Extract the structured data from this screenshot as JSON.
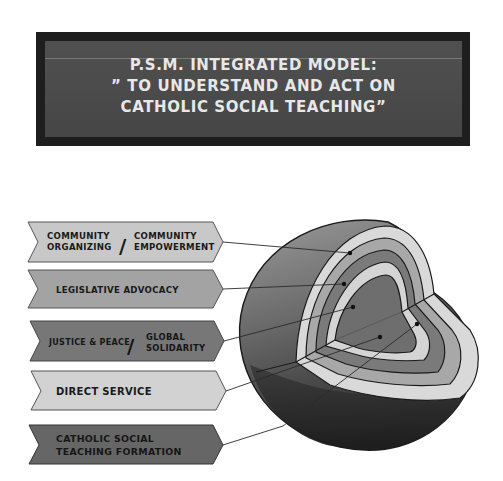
{
  "title": {
    "line1": "P.S.M.  INTEGRATED MODEL:",
    "line2": "” TO UNDERSTAND AND ACT ON",
    "line3": "CATHOLIC  SOCIAL TEACHING”"
  },
  "layers": [
    {
      "id": "community",
      "left_text": [
        "COMMUNITY",
        "ORGANIZING"
      ],
      "right_text": [
        "COMMUNITY",
        "EMPOWERMENT"
      ],
      "separator": "/",
      "fill": "#c8c8c8"
    },
    {
      "id": "legislative",
      "text": [
        "LEGISLATIVE  ADVOCACY"
      ],
      "fill": "#a3a3a3"
    },
    {
      "id": "justice",
      "left_text": [
        "JUSTICE & PEACE"
      ],
      "right_text": [
        "GLOBAL",
        "SOLIDARITY"
      ],
      "separator": "/",
      "fill": "#777777"
    },
    {
      "id": "direct",
      "text": [
        "DIRECT SERVICE"
      ],
      "fill": "#d2d2d2"
    },
    {
      "id": "cst",
      "text": [
        "CATHOLIC  SOCIAL",
        "TEACHING  FORMATION"
      ],
      "fill": "#666666"
    }
  ],
  "sphere": {
    "icon": "cutaway-sphere-icon",
    "ring_colors": [
      "#d9d9d9",
      "#a8a8a8",
      "#7a7a7a",
      "#d4d4d4",
      "#6e6e6e"
    ]
  }
}
